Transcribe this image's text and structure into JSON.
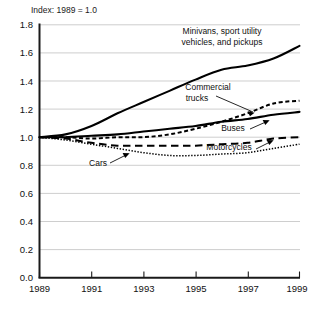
{
  "chart_data": {
    "type": "line",
    "title": "Index: 1989 = 1.0",
    "xlabel": "",
    "ylabel": "",
    "xlim": [
      1989,
      1999
    ],
    "ylim": [
      0.0,
      1.8
    ],
    "grid": true,
    "legend_position": "inline-annotations",
    "x": [
      1989,
      1990,
      1991,
      1992,
      1993,
      1994,
      1995,
      1996,
      1997,
      1998,
      1999
    ],
    "xticks": [
      "1989",
      "1991",
      "1993",
      "1995",
      "1997",
      "1999"
    ],
    "yticks": [
      "0.0",
      "0.2",
      "0.4",
      "0.6",
      "0.8",
      "1.0",
      "1.2",
      "1.4",
      "1.6",
      "1.8"
    ],
    "series": [
      {
        "name": "Minivans, sport utility vehicles, and pickups",
        "style": "solid-thick",
        "values": [
          1.0,
          1.02,
          1.08,
          1.17,
          1.25,
          1.33,
          1.41,
          1.48,
          1.51,
          1.56,
          1.65
        ]
      },
      {
        "name": "Commercial trucks",
        "style": "dotted",
        "values": [
          1.0,
          1.0,
          0.99,
          1.0,
          1.0,
          1.02,
          1.06,
          1.11,
          1.17,
          1.24,
          1.26
        ]
      },
      {
        "name": "Buses",
        "style": "solid",
        "values": [
          1.0,
          1.0,
          1.01,
          1.02,
          1.04,
          1.06,
          1.08,
          1.11,
          1.13,
          1.16,
          1.18
        ]
      },
      {
        "name": "Motorcycles",
        "style": "dashed",
        "values": [
          1.0,
          0.99,
          0.96,
          0.94,
          0.94,
          0.94,
          0.94,
          0.95,
          0.96,
          0.99,
          1.0
        ]
      },
      {
        "name": "Cars",
        "style": "fine-dotted",
        "values": [
          1.0,
          0.98,
          0.95,
          0.92,
          0.89,
          0.87,
          0.87,
          0.88,
          0.89,
          0.92,
          0.95
        ]
      }
    ],
    "annotations": [
      {
        "id": "minivans",
        "text_line1": "Minivans, sport utility",
        "text_line2": "vehicles, and pickups"
      },
      {
        "id": "commercial-trucks",
        "text_line1": "Commercial",
        "text_line2": "trucks"
      },
      {
        "id": "buses",
        "text_line1": "Buses"
      },
      {
        "id": "motorcycles",
        "text_line1": "Motorcycles"
      },
      {
        "id": "cars",
        "text_line1": "Cars"
      }
    ]
  }
}
